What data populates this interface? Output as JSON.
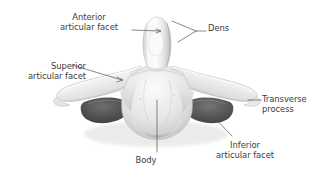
{
  "figure": {
    "background_color": "#ffffff",
    "label_color": "#3b3b3b",
    "leader_line_color": "#555555",
    "bone_light": "#fbfbfa",
    "bone_mid": "#dcdcda",
    "bone_shadow": "#b3b3b1",
    "foramen_dark": "#4e4e4e"
  },
  "labels": {
    "anterior_articular_facet": {
      "line1": "Anterior",
      "line2": "articular facet"
    },
    "dens": {
      "line1": "Dens"
    },
    "superior_articular_facet": {
      "line1": "Superior",
      "line2": "articular facet"
    },
    "transverse_process": {
      "line1": "Transverse",
      "line2": "process"
    },
    "inferior_articular_facet": {
      "line1": "Inferior",
      "line2": "articular facet"
    },
    "body": {
      "line1": "Body"
    }
  }
}
